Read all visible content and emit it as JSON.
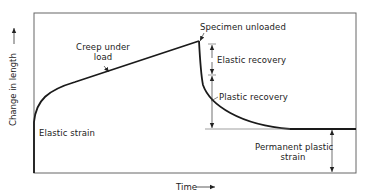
{
  "diagram": {
    "type": "creep-curve",
    "axes": {
      "x_label": "Time",
      "y_label": "Change in length",
      "x_arrow": "→",
      "y_arrow": "→"
    },
    "annotations": {
      "creep_under_load": [
        "Creep under",
        "load"
      ],
      "specimen_unloaded": "Specimen unloaded",
      "elastic_recovery": "Elastic recovery",
      "plastic_recovery": "Plastic recovery",
      "elastic_strain": "Elastic strain",
      "permanent_plastic_strain": [
        "Permanent plastic",
        "strain"
      ]
    },
    "colors": {
      "curve": "#1a1a1a",
      "frame": "#555555",
      "text": "#222222",
      "background": "#ffffff"
    }
  }
}
